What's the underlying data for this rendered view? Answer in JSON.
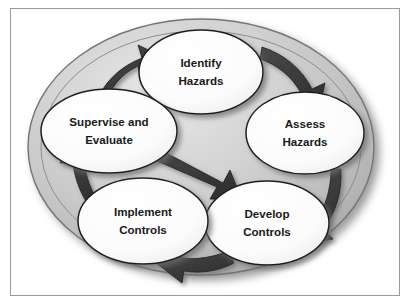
{
  "figure": {
    "clipped_header_text": "",
    "colors": {
      "frame_border": "#9a9a9a",
      "page_background": "#ffffff",
      "big_ellipse_light": "#e2e2e2",
      "big_ellipse_mid": "#c4c4c4",
      "big_ellipse_dark": "#a8a8a8",
      "big_ellipse_stroke": "#6f6f6f",
      "node_fill": "#fdfdfd",
      "node_stroke": "#1f1f1f",
      "arrow_fill": "#3d3d3d",
      "arrow_stroke": "#1a1a1a",
      "label_text": "#1a1a1a",
      "shadow": "#8f8f8f"
    }
  },
  "diagram": {
    "type": "cycle",
    "shape": "ellipse",
    "direction": "clockwise",
    "node_count": 5,
    "arrow_count": 5,
    "nodes": [
      {
        "id": "identify-hazards",
        "lines": [
          "Identify",
          "Hazards"
        ],
        "cx": 190,
        "cy": 63,
        "rx": 62,
        "ry": 42,
        "position": "top"
      },
      {
        "id": "assess-hazards",
        "lines": [
          "Assess",
          "Hazards"
        ],
        "cx": 294,
        "cy": 124,
        "rx": 59,
        "ry": 41,
        "position": "right"
      },
      {
        "id": "develop-controls",
        "lines": [
          "Develop",
          "Controls"
        ],
        "cx": 256,
        "cy": 214,
        "rx": 62,
        "ry": 42,
        "position": "bottom-right"
      },
      {
        "id": "implement-controls",
        "lines": [
          "Implement",
          "Controls"
        ],
        "cx": 132,
        "cy": 212,
        "rx": 65,
        "ry": 43,
        "position": "bottom-left"
      },
      {
        "id": "supervise-and-evaluate",
        "lines": [
          "Supervise and",
          "Evaluate"
        ],
        "cx": 98,
        "cy": 122,
        "rx": 68,
        "ry": 42,
        "position": "left"
      }
    ],
    "arrows": [
      {
        "id": "arrow-supervise-to-identify",
        "from": "supervise-and-evaluate",
        "to": "identify-hazards",
        "placement": "upper-left"
      },
      {
        "id": "arrow-identify-to-assess",
        "from": "identify-hazards",
        "to": "assess-hazards",
        "placement": "upper-right"
      },
      {
        "id": "arrow-assess-to-develop",
        "from": "assess-hazards",
        "to": "develop-controls",
        "placement": "lower-right"
      },
      {
        "id": "arrow-develop-to-implement",
        "from": "develop-controls",
        "to": "implement-controls",
        "placement": "bottom"
      },
      {
        "id": "arrow-implement-to-supervise",
        "from": "implement-controls",
        "to": "supervise-and-evaluate",
        "placement": "lower-left"
      },
      {
        "id": "arrow-center-supervise-to-develop",
        "from": "supervise-and-evaluate",
        "to": "develop-controls",
        "placement": "center-diagonal"
      }
    ]
  }
}
